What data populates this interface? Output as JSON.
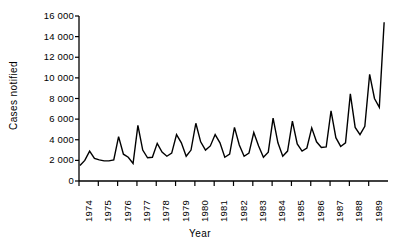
{
  "chart_data": {
    "type": "line",
    "title": "",
    "xlabel": "Year",
    "ylabel": "Cases notified",
    "ylim": [
      0,
      16000
    ],
    "xlim": [
      1974.0,
      1990.0
    ],
    "grid": false,
    "legend": null,
    "y_ticks": [
      0,
      2000,
      4000,
      6000,
      8000,
      10000,
      12000,
      14000,
      16000
    ],
    "y_tick_labels": [
      "0",
      "2 000",
      "4 000",
      "6 000",
      "8 000",
      "10 000",
      "12 000",
      "14 000",
      "16 000"
    ],
    "x_ticks": [
      1974,
      1975,
      1976,
      1977,
      1978,
      1979,
      1980,
      1981,
      1982,
      1983,
      1984,
      1985,
      1986,
      1987,
      1988,
      1989
    ],
    "x_tick_labels": [
      "1974",
      "1975",
      "1976",
      "1977",
      "1978",
      "1979",
      "1980",
      "1981",
      "1982",
      "1983",
      "1984",
      "1985",
      "1986",
      "1987",
      "1988",
      "1989"
    ],
    "series": [
      {
        "name": "Cases notified",
        "color": "#000000",
        "x": [
          1974.05,
          1974.3,
          1974.55,
          1974.8,
          1975.05,
          1975.3,
          1975.55,
          1975.8,
          1976.05,
          1976.3,
          1976.55,
          1976.8,
          1977.05,
          1977.3,
          1977.55,
          1977.8,
          1978.05,
          1978.3,
          1978.55,
          1978.8,
          1979.05,
          1979.3,
          1979.55,
          1979.8,
          1980.05,
          1980.3,
          1980.55,
          1980.8,
          1981.05,
          1981.3,
          1981.55,
          1981.8,
          1982.05,
          1982.3,
          1982.55,
          1982.8,
          1983.05,
          1983.3,
          1983.55,
          1983.8,
          1984.05,
          1984.3,
          1984.55,
          1984.8,
          1985.05,
          1985.3,
          1985.55,
          1985.8,
          1986.05,
          1986.3,
          1986.55,
          1986.8,
          1987.05,
          1987.3,
          1987.55,
          1987.8,
          1988.05,
          1988.3,
          1988.55,
          1988.8,
          1989.05,
          1989.3,
          1989.55,
          1989.8
        ],
        "values": [
          1500,
          2000,
          2900,
          2200,
          2050,
          1950,
          1950,
          2050,
          4300,
          2600,
          2300,
          1700,
          5400,
          3000,
          2250,
          2300,
          3650,
          2800,
          2400,
          2700,
          4500,
          3700,
          2400,
          3000,
          5600,
          3800,
          3000,
          3400,
          4500,
          3700,
          2300,
          2600,
          5200,
          3500,
          2400,
          2700,
          4700,
          3400,
          2300,
          2800,
          6100,
          3700,
          2400,
          2900,
          5800,
          3600,
          2900,
          3200,
          5150,
          3800,
          3250,
          3300,
          6800,
          4200,
          3350,
          3700,
          8450,
          5200,
          4500,
          5300,
          10350,
          8000,
          7150,
          15400
        ]
      }
    ]
  },
  "axes": {
    "y_axis_name": "y-axis",
    "x_axis_name": "x-axis"
  }
}
